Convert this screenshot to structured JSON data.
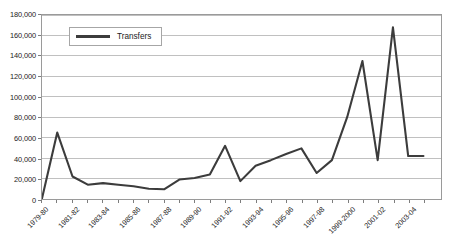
{
  "chart_data": {
    "type": "line",
    "title": "",
    "xlabel": "",
    "ylabel": "",
    "ylim": [
      0,
      180000
    ],
    "ytick_step": 20000,
    "grid": true,
    "grid_axis": "y",
    "legend_position": "top-left",
    "line_color": "#3c3c3c",
    "grid_color": "#bfbfbf",
    "frame_color": "#9a9a9a",
    "ytick_labels": [
      "0",
      "20,000",
      "40,000",
      "60,000",
      "80,000",
      "100,000",
      "120,000",
      "140,000",
      "160,000",
      "180,000"
    ],
    "ytick_values": [
      0,
      20000,
      40000,
      60000,
      80000,
      100000,
      120000,
      140000,
      160000,
      180000
    ],
    "categories": [
      "1979-80",
      "1980-81",
      "1981-82",
      "1982-83",
      "1983-84",
      "1984-85",
      "1985-86",
      "1986-87",
      "1987-88",
      "1988-89",
      "1989-90",
      "1990-91",
      "1991-92",
      "1992-93",
      "1993-94",
      "1994-95",
      "1995-96",
      "1996-97",
      "1997-98",
      "1998-99",
      "1999-2000",
      "2000-01",
      "2001-02",
      "2002-03",
      "2003-04",
      "2004-05"
    ],
    "xtick_labels_shown": [
      "1979-80",
      "1981-82",
      "1983-84",
      "1985-86",
      "1987-88",
      "1989-90",
      "1991-92",
      "1993-94",
      "1995-96",
      "1997-98",
      "1999-2000",
      "2001-02",
      "2003-04"
    ],
    "series": [
      {
        "name": "Transfers",
        "values": [
          500,
          65000,
          22000,
          14000,
          15500,
          14000,
          12500,
          10000,
          9500,
          19000,
          20500,
          24000,
          52000,
          17500,
          32500,
          38000,
          44000,
          49500,
          25500,
          38000,
          80000,
          135000,
          38000,
          168000,
          42000,
          42000
        ]
      }
    ]
  },
  "legend": {
    "entries": [
      {
        "label": "Transfers",
        "swatch": "line-swatch"
      }
    ]
  }
}
